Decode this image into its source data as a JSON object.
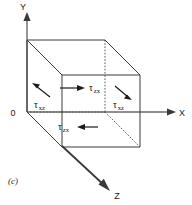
{
  "figure": {
    "caption": "(c)",
    "origin_label": "0",
    "background_color": "#ffffff",
    "line_color": "#3a3a3a"
  },
  "axes": [
    {
      "name": "y-axis",
      "label": "Y",
      "direction": "up"
    },
    {
      "name": "x-axis",
      "label": "X",
      "direction": "right"
    },
    {
      "name": "z-axis",
      "label": "Z",
      "direction": "down-right"
    }
  ],
  "stress_labels": [
    {
      "name": "tau-zx-top",
      "symbol": "τ",
      "subscript": "zx",
      "arrow": "right"
    },
    {
      "name": "tau-xz-left",
      "symbol": "τ",
      "subscript": "xz",
      "arrow": "up-left"
    },
    {
      "name": "tau-xz-right",
      "symbol": "τ",
      "subscript": "xz",
      "arrow": "down-right"
    },
    {
      "name": "tau-zx-bottom",
      "symbol": "τ",
      "subscript": "zx",
      "arrow": "left"
    }
  ]
}
